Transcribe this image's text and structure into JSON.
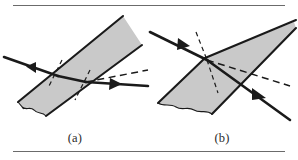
{
  "figure": {
    "kind": "optics-refraction-diagram",
    "background_color": "#ffffff",
    "rule_color": "#6b6b6b",
    "panels": [
      {
        "id": "a",
        "caption": "(a)",
        "medium_label": "parallel-sided slab",
        "medium_fill": "#c9c9c9",
        "medium_stroke": "#1a1a1a",
        "ray_color": "#1a1a1a",
        "normal_style": "dashed",
        "rays": [
          {
            "name": "incident-ray",
            "direction": "down-right",
            "arrow": true
          },
          {
            "name": "refracted-ray-inside-slab",
            "direction": "down-right",
            "arrow": false
          },
          {
            "name": "emergent-ray",
            "direction": "down-right",
            "arrow": true
          },
          {
            "name": "undeviated-extension",
            "direction": "up-right",
            "style": "dashed",
            "arrow": false
          }
        ],
        "normals": [
          {
            "name": "normal-at-entry-face"
          },
          {
            "name": "normal-at-exit-face"
          }
        ]
      },
      {
        "id": "b",
        "caption": "(b)",
        "medium_label": "wedge / prism",
        "medium_fill": "#c9c9c9",
        "medium_stroke": "#1a1a1a",
        "ray_color": "#1a1a1a",
        "normal_style": "dashed",
        "rays": [
          {
            "name": "incident-ray",
            "direction": "down-right",
            "arrow": true
          },
          {
            "name": "emergent-ray",
            "direction": "down-right",
            "arrow": true
          },
          {
            "name": "undeviated-extension",
            "direction": "down-right",
            "style": "dashed",
            "arrow": false
          }
        ],
        "normals": [
          {
            "name": "normal-at-apex-upper"
          },
          {
            "name": "normal-at-apex-lower"
          }
        ]
      }
    ]
  }
}
